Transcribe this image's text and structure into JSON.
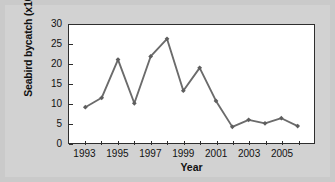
{
  "chart_data": {
    "type": "line",
    "title": "",
    "xlabel": "Year",
    "ylabel": "Seabird bycatch (x1000)",
    "x": [
      1993,
      1994,
      1995,
      1996,
      1997,
      1998,
      1999,
      2000,
      2001,
      2002,
      2003,
      2004,
      2005,
      2006
    ],
    "values": [
      9.1,
      11.5,
      21.2,
      10.1,
      22.0,
      26.5,
      13.3,
      19.1,
      10.7,
      4.1,
      5.9,
      5.0,
      6.3,
      4.3
    ],
    "series": [
      {
        "name": "Seabird bycatch",
        "values": [
          9.1,
          11.5,
          21.2,
          10.1,
          22.0,
          26.5,
          13.3,
          19.1,
          10.7,
          4.1,
          5.9,
          5.0,
          6.3,
          4.3
        ]
      }
    ],
    "xlim": [
      1992,
      2007
    ],
    "ylim": [
      0,
      30
    ],
    "ytick_labels": [
      "0",
      "5",
      "10",
      "15",
      "20",
      "25",
      "30"
    ],
    "yticks": [
      0,
      5,
      10,
      15,
      20,
      25,
      30
    ],
    "xtick_labels": [
      "1993",
      "1995",
      "1997",
      "1999",
      "2001",
      "2003",
      "2005"
    ],
    "xticks": [
      1993,
      1995,
      1997,
      1999,
      2001,
      2003,
      2005
    ],
    "xticks_minor": [
      1994,
      1996,
      1998,
      2000,
      2002,
      2004,
      2006
    ],
    "grid": false,
    "legend": false,
    "legend_position": "none",
    "marker": "diamond",
    "line_color": "#6b6b6b",
    "marker_color": "#5e5e5e",
    "axis_color": "#2e2e2e",
    "plot_background": "#ffffff",
    "figure_background": "#d2d2d2"
  }
}
